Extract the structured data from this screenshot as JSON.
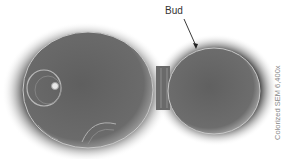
{
  "figure": {
    "labels": {
      "bud": "Bud"
    },
    "caption": "Colorized SEM 6,400x",
    "colors": {
      "background": "#ffffff",
      "cell_fill": "#6e6e6e",
      "cell_highlight": "#bdbdbd",
      "shadow": "#1e1e1e"
    }
  }
}
